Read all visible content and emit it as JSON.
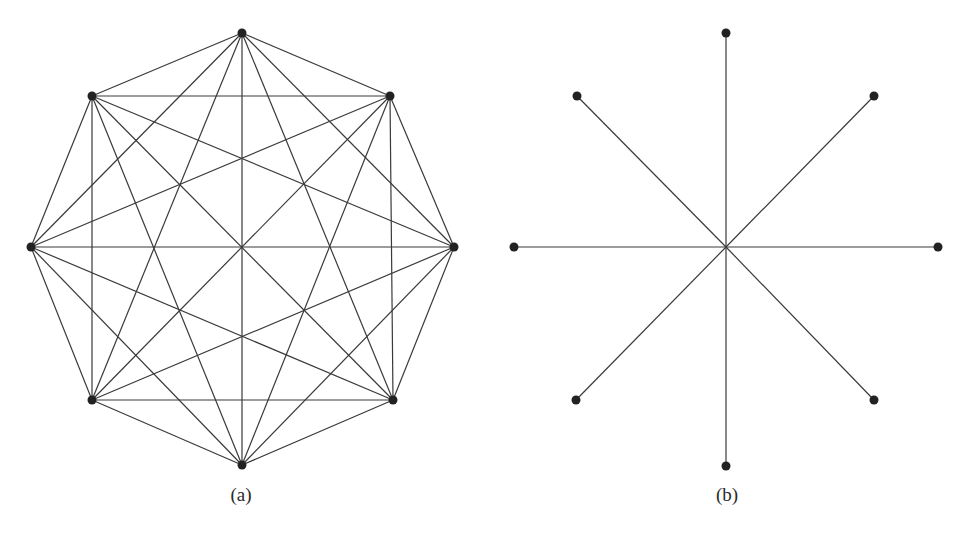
{
  "figures": [
    {
      "id": "a",
      "label": "(a)",
      "type": "complete-graph",
      "description": "Complete graph K8 on 8 vertices arranged as an octagon",
      "nodes": [
        {
          "x": 242,
          "y": 33
        },
        {
          "x": 390,
          "y": 96
        },
        {
          "x": 454,
          "y": 247
        },
        {
          "x": 393,
          "y": 400
        },
        {
          "x": 242,
          "y": 465
        },
        {
          "x": 92,
          "y": 400
        },
        {
          "x": 31,
          "y": 247
        },
        {
          "x": 92,
          "y": 96
        }
      ],
      "label_pos": {
        "x": 241,
        "y": 484
      }
    },
    {
      "id": "b",
      "label": "(b)",
      "type": "star-graph",
      "description": "Star with 8 spokes from a central hub to 8 outer vertices",
      "center": {
        "x": 726,
        "y": 247
      },
      "nodes": [
        {
          "x": 726,
          "y": 33
        },
        {
          "x": 874,
          "y": 96
        },
        {
          "x": 938,
          "y": 247
        },
        {
          "x": 874,
          "y": 400
        },
        {
          "x": 726,
          "y": 466
        },
        {
          "x": 576,
          "y": 400
        },
        {
          "x": 514,
          "y": 247
        },
        {
          "x": 577,
          "y": 96
        }
      ],
      "label_pos": {
        "x": 727,
        "y": 484
      }
    }
  ],
  "style": {
    "edge_color": "#3a3a3a",
    "node_color": "#222222",
    "node_radius": 4.5,
    "edge_width": 1.2
  }
}
